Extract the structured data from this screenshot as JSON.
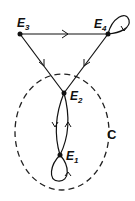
{
  "diagram": {
    "type": "state-transition-graph",
    "nodes": [
      {
        "id": "E3",
        "label": "E",
        "sub": "3",
        "x": 20,
        "y": 34
      },
      {
        "id": "E4",
        "label": "E",
        "sub": "4",
        "x": 108,
        "y": 34
      },
      {
        "id": "E2",
        "label": "E",
        "sub": "2",
        "x": 64,
        "y": 93
      },
      {
        "id": "E1",
        "label": "E",
        "sub": "1",
        "x": 60,
        "y": 155
      }
    ],
    "edges": [
      {
        "from": "E3",
        "to": "E4"
      },
      {
        "from": "E3",
        "to": "E2"
      },
      {
        "from": "E4",
        "to": "E2"
      },
      {
        "from": "E4",
        "to": "E4"
      },
      {
        "from": "E2",
        "to": "E1"
      },
      {
        "from": "E1",
        "to": "E2"
      },
      {
        "from": "E1",
        "to": "E1"
      }
    ],
    "region": {
      "label": "C",
      "contains": [
        "E1",
        "E2"
      ],
      "style": "dashed"
    }
  }
}
